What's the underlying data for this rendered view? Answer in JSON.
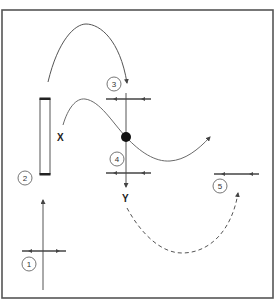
{
  "diagram": {
    "labels": {
      "x": "X",
      "y": "Y"
    },
    "steps": [
      {
        "id": 1,
        "label": "1"
      },
      {
        "id": 2,
        "label": "2"
      },
      {
        "id": 3,
        "label": "3"
      },
      {
        "id": 4,
        "label": "4"
      },
      {
        "id": 5,
        "label": "5"
      }
    ],
    "colors": {
      "frame": "#555555",
      "line": "#555555",
      "curve": "#6a6a6a",
      "dot": "#111111",
      "background": "#ffffff"
    }
  }
}
